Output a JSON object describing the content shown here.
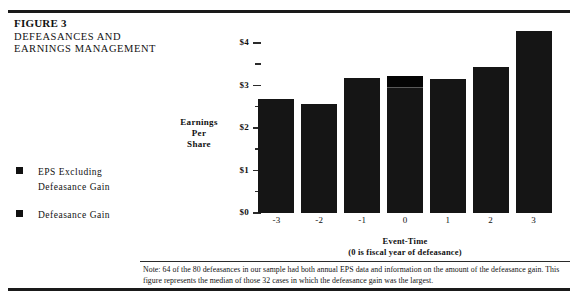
{
  "figure": {
    "label": "FIGURE 3",
    "title_lines": [
      "DEFEASANCES AND",
      "EARNINGS MANAGEMENT"
    ]
  },
  "legend": {
    "items": [
      {
        "swatch": "eps-excluding-defeasance-gain-swatch",
        "lines": [
          "EPS  Excluding",
          "Defeasance  Gain"
        ],
        "color": "#151515"
      },
      {
        "swatch": "defeasance-gain-swatch",
        "lines": [
          "Defeasance  Gain"
        ],
        "color": "#050505"
      }
    ]
  },
  "note": {
    "text": "Note: 64 of the 80 defeasances in our sample had both annual EPS data and information on the amount of the defeasance gain.  This figure represents the median of those 32 cases in which the defeasance gain was the largest."
  },
  "chart_data": {
    "type": "bar",
    "title": "DEFEASANCES AND EARNINGS MANAGEMENT",
    "xlabel": "Event-Time (0 is fiscal year of defeasance)",
    "xlabel_lines": [
      "Event-Time",
      "(0 is fiscal year of defeasance)"
    ],
    "ylabel": "Earnings Per Share",
    "ylabel_lines": [
      "Earnings",
      "Per",
      "Share"
    ],
    "categories": [
      "-3",
      "-2",
      "-1",
      "0",
      "1",
      "2",
      "3"
    ],
    "ylim": [
      0,
      4.5
    ],
    "ytick_values": [
      0,
      0.5,
      1,
      1.5,
      2,
      2.5,
      3,
      3.5,
      4
    ],
    "ytick_labels": [
      "$0",
      "",
      "$1",
      "",
      "$2",
      "",
      "$3",
      "",
      "$4"
    ],
    "grid": false,
    "legend_position": "left",
    "stacked": true,
    "series": [
      {
        "name": "EPS Excluding Defeasance Gain",
        "color": "#151515",
        "values": [
          2.68,
          2.56,
          3.18,
          2.95,
          3.16,
          3.45,
          4.29
        ]
      },
      {
        "name": "Defeasance Gain",
        "color": "#050505",
        "values": [
          0,
          0,
          0,
          0.28,
          0,
          0,
          0
        ]
      }
    ],
    "totals": [
      2.68,
      2.56,
      3.18,
      3.23,
      3.16,
      3.45,
      4.29
    ]
  }
}
